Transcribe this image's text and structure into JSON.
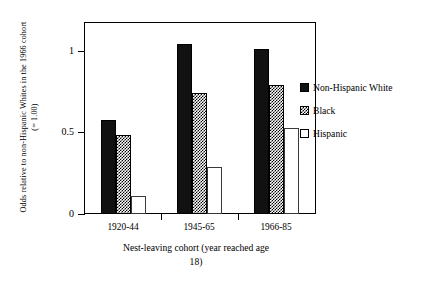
{
  "chart_data": {
    "type": "bar",
    "title": "",
    "subtitle": "",
    "categories": [
      "1920-44",
      "1945-65",
      "1966-85"
    ],
    "series": [
      {
        "name": "Non-Hispanic White",
        "values": [
          0.58,
          1.05,
          1.02
        ],
        "fill": "solid-black",
        "color": "#111111"
      },
      {
        "name": "Black",
        "values": [
          0.49,
          0.75,
          0.8
        ],
        "fill": "hatched",
        "color": "#000000"
      },
      {
        "name": "Hispanic",
        "values": [
          0.11,
          0.29,
          0.53
        ],
        "fill": "empty-white",
        "color": "#ffffff"
      }
    ],
    "xlabel": "Nest-leaving cohort (year reached age 18)",
    "xlabel_line1": "Nest-leaving cohort (year reached age",
    "xlabel_line2": "18)",
    "ylabel": "Odds relative to non-Hispanic Whites in the 1966 cohort (= 1.00)",
    "ylabel_line1": "Odds relative to non-Hispanic Whites in the 1966 cohort",
    "ylabel_line2": "(= 1.00)",
    "ylim": [
      0,
      1.18
    ],
    "yticks": [
      0,
      0.5,
      1
    ],
    "ytick_labels": [
      "0",
      "0.5",
      "1"
    ],
    "grid": false,
    "legend_position": "right"
  },
  "legend": {
    "entries": [
      {
        "label": "Non-Hispanic White"
      },
      {
        "label": "Black"
      },
      {
        "label": "Hispanic"
      }
    ]
  },
  "axes": {
    "y_title_line1": "Odds relative to non-Hispanic Whites in the 1966 cohort",
    "y_title_line2": "(= 1.00)",
    "x_title_line1": "Nest-leaving cohort (year reached age",
    "x_title_line2": "18)",
    "ytick_0": "0",
    "ytick_1": "0.5",
    "ytick_2": "1",
    "xtick_0": "1920-44",
    "xtick_1": "1945-65",
    "xtick_2": "1966-85"
  }
}
